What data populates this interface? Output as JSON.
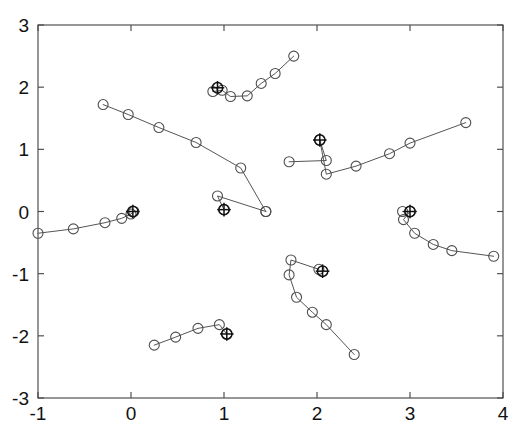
{
  "chart_data": {
    "type": "scatter",
    "title": "",
    "xlabel": "",
    "ylabel": "",
    "xlim": [
      -1,
      4
    ],
    "ylim": [
      -3,
      3
    ],
    "xticks": [
      -1,
      0,
      1,
      2,
      3,
      4
    ],
    "yticks": [
      -3,
      -2,
      -1,
      0,
      1,
      2,
      3
    ],
    "xtick_labels": [
      "-1",
      "0",
      "1",
      "2",
      "3",
      "4"
    ],
    "ytick_labels": [
      "-3",
      "-2",
      "-1",
      "0",
      "1",
      "2",
      "3"
    ],
    "grid": false,
    "legend": null,
    "marker": "circle",
    "cluster_marker": "circle-plus",
    "line_color": "#555555",
    "marker_color": "#4f4f4f",
    "cluster_color": "#111111",
    "axis_color": "#4a4a4a",
    "background": "#ffffff",
    "series": [
      {
        "name": "trajectory-1-upper-left-descending",
        "points": [
          [
            -0.3,
            1.72
          ],
          [
            -0.03,
            1.56
          ],
          [
            0.3,
            1.35
          ],
          [
            0.7,
            1.11
          ],
          [
            1.18,
            0.7
          ],
          [
            1.45,
            0.0
          ]
        ],
        "cluster": null
      },
      {
        "name": "trajectory-2-center-to-cluster-origin",
        "points": [
          [
            1.45,
            0.0
          ],
          [
            0.93,
            0.25
          ],
          [
            1.0,
            0.03
          ]
        ],
        "cluster": [
          1.0,
          0.03
        ]
      },
      {
        "name": "trajectory-3-upper-center-ascending",
        "points": [
          [
            0.88,
            1.93
          ],
          [
            0.98,
            1.95
          ],
          [
            1.07,
            1.85
          ],
          [
            1.25,
            1.86
          ],
          [
            1.4,
            2.06
          ],
          [
            1.55,
            2.22
          ],
          [
            1.75,
            2.5
          ]
        ],
        "cluster": [
          0.93,
          1.99
        ]
      },
      {
        "name": "trajectory-4-right-v-shape-ascending",
        "points": [
          [
            1.7,
            0.8
          ],
          [
            2.1,
            0.82
          ],
          [
            2.03,
            1.15
          ],
          [
            2.1,
            0.6
          ],
          [
            2.42,
            0.73
          ],
          [
            2.78,
            0.93
          ],
          [
            3.0,
            1.1
          ],
          [
            3.6,
            1.43
          ]
        ],
        "cluster": [
          2.03,
          1.15
        ]
      },
      {
        "name": "trajectory-5-right-lower-descending",
        "points": [
          [
            2.92,
            0.0
          ],
          [
            3.0,
            0.0
          ],
          [
            2.93,
            -0.13
          ],
          [
            3.05,
            -0.35
          ],
          [
            3.25,
            -0.53
          ],
          [
            3.45,
            -0.63
          ],
          [
            3.9,
            -0.72
          ]
        ],
        "cluster": [
          3.0,
          0.0
        ]
      },
      {
        "name": "trajectory-6-bottom-center-j-curve",
        "points": [
          [
            2.02,
            -0.93
          ],
          [
            1.72,
            -0.78
          ],
          [
            1.7,
            -1.02
          ],
          [
            1.78,
            -1.38
          ],
          [
            1.95,
            -1.62
          ],
          [
            2.1,
            -1.82
          ],
          [
            2.4,
            -2.3
          ]
        ],
        "cluster": [
          2.06,
          -0.96
        ]
      },
      {
        "name": "trajectory-7-bottom-left-ascending",
        "points": [
          [
            0.25,
            -2.15
          ],
          [
            0.48,
            -2.02
          ],
          [
            0.72,
            -1.88
          ],
          [
            0.95,
            -1.82
          ],
          [
            1.03,
            -1.97
          ]
        ],
        "cluster": [
          1.03,
          -1.97
        ]
      },
      {
        "name": "trajectory-8-left-ascending-to-origin",
        "points": [
          [
            -1.0,
            -0.35
          ],
          [
            -0.62,
            -0.28
          ],
          [
            -0.28,
            -0.18
          ],
          [
            -0.1,
            -0.11
          ],
          [
            0.0,
            -0.04
          ],
          [
            0.03,
            0.0
          ]
        ],
        "cluster": [
          0.02,
          0.0
        ]
      }
    ]
  }
}
